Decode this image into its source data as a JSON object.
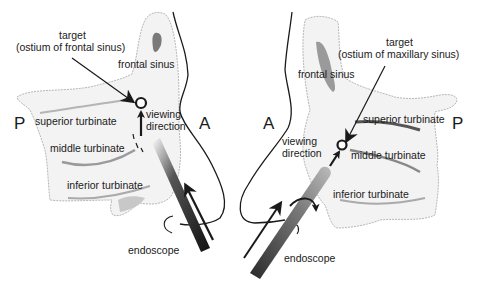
{
  "left_panel": {
    "target_title": "target",
    "target_subtitle": "(ostium of frontal sinus)",
    "frontal_sinus": "frontal sinus",
    "superior_turbinate": "superior turbinate",
    "middle_turbinate": "middle turbinate",
    "inferior_turbinate": "inferior turbinate",
    "viewing_line1": "viewing",
    "viewing_line2": "direction",
    "posterior": "P",
    "anterior": "A",
    "endoscope": "endoscope"
  },
  "right_panel": {
    "target_title": "target",
    "target_subtitle": "(ostium of maxillary sinus)",
    "frontal_sinus": "frontal sinus",
    "superior_turbinate": "superior turbinate",
    "middle_turbinate": "middle turbinate",
    "inferior_turbinate": "inferior turbinate",
    "viewing_line1": "viewing",
    "viewing_line2": "direction",
    "posterior": "P",
    "anterior": "A",
    "endoscope": "endoscope"
  },
  "colors": {
    "ink": "#1a1a1a",
    "tissue_shade": "#9a9a9a",
    "tissue_light": "#f2f2f2"
  }
}
